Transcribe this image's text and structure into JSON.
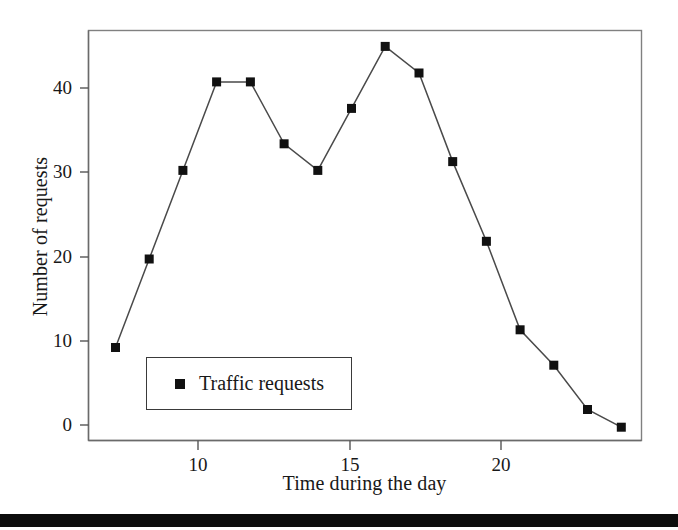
{
  "chart_data": {
    "type": "line",
    "title": "",
    "xlabel": "Time during the day",
    "ylabel": "Number of requests",
    "x": [
      8,
      9,
      10,
      11,
      12,
      13,
      14,
      15,
      16,
      17,
      18,
      19,
      20,
      21,
      22,
      23
    ],
    "values": [
      10,
      20,
      30,
      40,
      40,
      33,
      30,
      37,
      44,
      41,
      31,
      22,
      12,
      8,
      3,
      1
    ],
    "series": [
      {
        "name": "Traffic requests",
        "values": [
          10,
          20,
          30,
          40,
          40,
          33,
          30,
          37,
          44,
          41,
          31,
          22,
          12,
          8,
          3,
          1
        ]
      }
    ],
    "xlim": [
      7.2,
      23.6
    ],
    "ylim": [
      -0.5,
      45.8
    ],
    "xticks": [
      10,
      15,
      20
    ],
    "xticklabels": [
      "10",
      "15",
      "20"
    ],
    "yticks": [
      0,
      10,
      20,
      30,
      40
    ],
    "yticklabels": [
      "0",
      "10",
      "20",
      "30",
      "40"
    ],
    "grid": false,
    "legend": {
      "entries": [
        "Traffic requests"
      ],
      "position": "lower-left-inside",
      "marker": "square",
      "marker_color": "#111111"
    },
    "line_color": "#444444",
    "marker_color": "#111111",
    "marker_style": "square",
    "frame": true
  },
  "axes": {
    "y_label": "Number of requests",
    "x_label": "Time during the day",
    "y_ticks": [
      "0",
      "10",
      "20",
      "30",
      "40"
    ],
    "x_ticks": [
      "10",
      "15",
      "20"
    ]
  },
  "legend": {
    "label": "Traffic requests"
  },
  "colors": {
    "line": "#444444",
    "marker": "#111111",
    "frame": "#707070",
    "axis": "#585858",
    "text": "#181818",
    "background": "#ffffff",
    "scan_bar": "#0d0d0d"
  }
}
